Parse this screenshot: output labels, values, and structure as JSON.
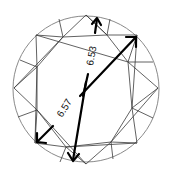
{
  "diagram": {
    "type": "round brilliant diamond top view",
    "measurements": [
      {
        "id": "diameter_1",
        "label": "6.53",
        "unit": "mm"
      },
      {
        "id": "diameter_2",
        "label": "6.57",
        "unit": "mm"
      }
    ],
    "colors": {
      "background": "#ffffff",
      "facet_lines": "#3a3a3a",
      "girdle": "#8a8a8a",
      "arrows": "#000000"
    }
  }
}
